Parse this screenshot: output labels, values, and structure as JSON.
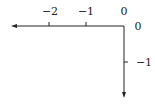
{
  "diagram": {
    "type": "coordinate-axes",
    "colors": {
      "axis": "#222222",
      "background": "#ffffff"
    },
    "x_axis": {
      "direction": "left",
      "ticks": [
        {
          "value": -2,
          "label": "−2"
        },
        {
          "value": -1,
          "label": "−1"
        },
        {
          "value": 0,
          "label": "0"
        }
      ]
    },
    "y_axis": {
      "direction": "down",
      "ticks": [
        {
          "value": 0,
          "label": "0"
        },
        {
          "value": -1,
          "label": "−1"
        }
      ]
    }
  }
}
